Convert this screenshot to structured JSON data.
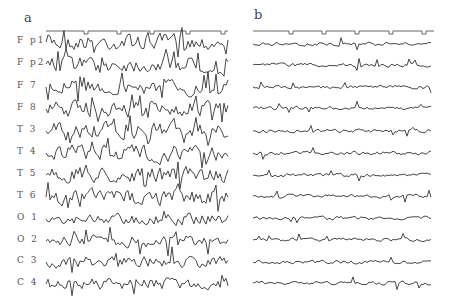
{
  "figure": {
    "panels": [
      {
        "id": "a",
        "label": "a",
        "description": "high-amplitude irregular EEG traces",
        "channels": [
          "F p1",
          "F p2",
          "F 7",
          "F 8",
          "T 3",
          "T 4",
          "T 5",
          "T 6",
          "O 1",
          "O 2",
          "C 3",
          "C 4"
        ]
      },
      {
        "id": "b",
        "label": "b",
        "description": "low-amplitude EEG traces, same channels, unlabeled",
        "channel_count": 12
      }
    ],
    "trace_color": "#333333",
    "background": "#ffffff"
  }
}
